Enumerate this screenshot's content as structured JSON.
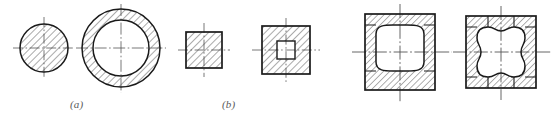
{
  "sheet": {
    "title": "Cross-section hatching examples",
    "width": 553,
    "height": 120,
    "background_color": "#ffffff",
    "line_color": "#1a1a1a",
    "hatch_color": "#2b2b2b",
    "centerline_color": "#555555",
    "caption_color": "#5a5a5a"
  },
  "captions": [
    {
      "key": "a",
      "text": "(a)",
      "x": 70,
      "y": 98
    },
    {
      "key": "b",
      "text": "(b)",
      "x": 222,
      "y": 98
    }
  ],
  "figures": [
    {
      "id": "solid-circle",
      "label": "(a)",
      "type": "circle",
      "fill": "hatched",
      "center": [
        44,
        48
      ],
      "outer_radius": 24,
      "inner_radius": 0,
      "hatch_angle_deg": 45,
      "hatch_spacing": 5,
      "centerline": true
    },
    {
      "id": "annulus",
      "label": "(a)",
      "type": "annulus",
      "fill": "hatched-ring",
      "center": [
        121,
        48
      ],
      "outer_radius": 39,
      "inner_radius": 28,
      "hatch_angle_deg": 45,
      "hatch_spacing": 5,
      "centerline": true
    },
    {
      "id": "solid-square",
      "label": "(b)",
      "type": "square",
      "fill": "hatched",
      "center": [
        204,
        50
      ],
      "outer_size": 36,
      "inner_size": 0,
      "hatch_angle_deg": 45,
      "hatch_spacing": 5,
      "centerline": true
    },
    {
      "id": "square-with-square-hole",
      "label": "(b)",
      "type": "square-tube",
      "fill": "hatched-frame",
      "center": [
        286,
        50
      ],
      "outer_size": 48,
      "inner_size": 18,
      "hatch_angle_deg": 45,
      "hatch_spacing": 5,
      "centerline": true
    },
    {
      "id": "square-tube-rounded-cavity",
      "type": "square-tube-rounded",
      "fill": "hatched-frame",
      "center": [
        400,
        52
      ],
      "outer_width": 70,
      "outer_height": 76,
      "wall_thickness": 11,
      "inner_corner_radius": 17,
      "hatch_angle_deg": 45,
      "hatch_spacing": 5,
      "centerline": true
    },
    {
      "id": "square-tube-scalloped-cavity",
      "type": "square-tube-scalloped",
      "fill": "hatched-frame",
      "center": [
        501,
        52
      ],
      "outer_width": 70,
      "outer_height": 72,
      "wall_thickness": 11,
      "scallop_radius": 15,
      "hatch_angle_deg": 45,
      "hatch_spacing": 5,
      "centerline": true
    }
  ]
}
